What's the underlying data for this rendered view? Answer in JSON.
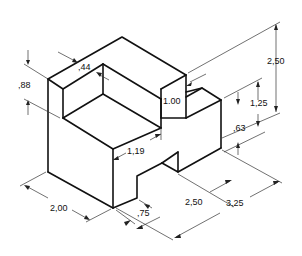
{
  "figure": {
    "dimensions": [
      {
        "id": "notch_height",
        "label": ",88"
      },
      {
        "id": "wall_thickness",
        "label": ",44"
      },
      {
        "id": "overall_height",
        "label": "2,50"
      },
      {
        "id": "inner_depth",
        "label": "1.00"
      },
      {
        "id": "step_height",
        "label": "1,25"
      },
      {
        "id": "slot_height",
        "label": ",63"
      },
      {
        "id": "notch_width",
        "label": "1,19"
      },
      {
        "id": "depth",
        "label": "2,00"
      },
      {
        "id": "slot_offset",
        "label": ",75"
      },
      {
        "id": "slot_length",
        "label": "2,50"
      },
      {
        "id": "overall_length",
        "label": "3,25"
      }
    ]
  },
  "colors": {
    "line": "#111111",
    "dimension": "#333333",
    "background": "#ffffff"
  }
}
